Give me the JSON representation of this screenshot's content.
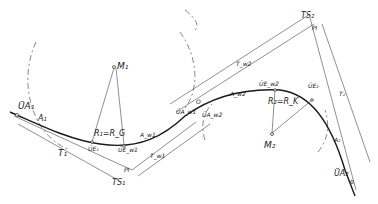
{
  "diagram": {
    "type": "road alignment: clothoid transition curves between two circular arcs (S-curve)",
    "labels": {
      "ua1": "ÜA₁",
      "a1": "A₁",
      "t1": "T₁",
      "ue1": "ÜE₁",
      "r1": "R₁=R_G",
      "uew1": "ÜE_w1",
      "aw1": "A_w1",
      "tw1": "T_w1",
      "ts1": "TS₁",
      "pi1": "PI",
      "m1": "M₁",
      "uaw1": "ÜA_w1",
      "uaw2": "ÜA_w2",
      "o": "O",
      "tw2": "T_w2",
      "aw2": "A_w2",
      "uew2": "ÜE_w2",
      "r2": "R₂=R_K",
      "m2": "M₂",
      "ts2": "TS₂",
      "pi2": "PI",
      "ue2": "ÜE₂",
      "a2": "A₂",
      "t2": "T₂",
      "ua2": "ÜA₂"
    }
  }
}
